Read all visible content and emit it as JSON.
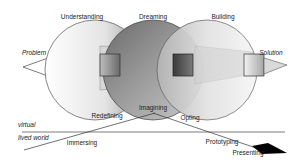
{
  "diagram": {
    "phases": {
      "understanding": "Understanding",
      "dreaming": "Dreaming",
      "building": "Building"
    },
    "endpoints": {
      "problem": "Problem",
      "solution": "Solution"
    },
    "layers": {
      "virtual": "virtual",
      "lived_world": "lived world"
    },
    "activities": {
      "redefining": "Redefining",
      "imagining": "Imagining",
      "opting": "Opting",
      "immersing": "Immersing",
      "prototyping": "Prototyping",
      "presenting": "Presenting"
    }
  }
}
